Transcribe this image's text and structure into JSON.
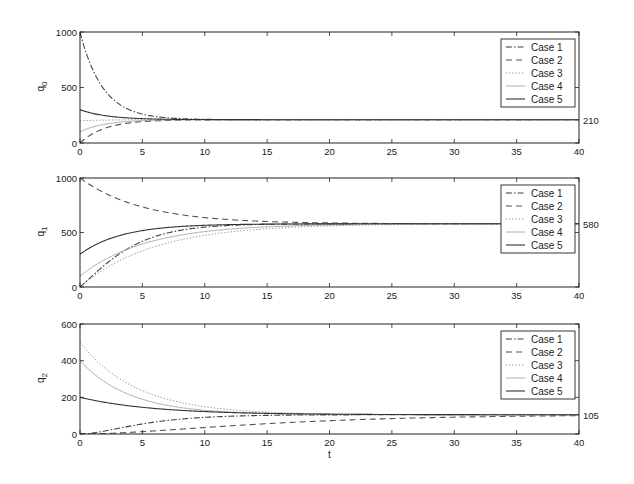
{
  "chart_data": [
    {
      "type": "line",
      "panel": "top",
      "ylabel": "q",
      "ylabel_sub": "0",
      "xlabel": "",
      "xlim": [
        0,
        40
      ],
      "ylim": [
        0,
        1000
      ],
      "xticks": [
        0,
        5,
        10,
        15,
        20,
        25,
        30,
        35,
        40
      ],
      "yticks": [
        0,
        500,
        1000
      ],
      "steady_state_label": "210",
      "steady_state": 210,
      "legend": [
        "Case 1",
        "Case 2",
        "Case 3",
        "Case 4",
        "Case 5"
      ],
      "legend_position": "upper right",
      "grid": false,
      "series": [
        {
          "name": "Case 1",
          "style": "dashdot",
          "initial": 1000,
          "rate": 0.55
        },
        {
          "name": "Case 2",
          "style": "dashed",
          "initial": 0,
          "rate": 0.5
        },
        {
          "name": "Case 3",
          "style": "dotted",
          "initial": 200,
          "rate": 0.5
        },
        {
          "name": "Case 4",
          "style": "thin",
          "initial": 100,
          "rate": 0.5
        },
        {
          "name": "Case 5",
          "style": "solid",
          "initial": 300,
          "rate": 0.45
        }
      ]
    },
    {
      "type": "line",
      "panel": "middle",
      "ylabel": "q",
      "ylabel_sub": "1",
      "xlabel": "",
      "xlim": [
        0,
        40
      ],
      "ylim": [
        0,
        1000
      ],
      "xticks": [
        0,
        5,
        10,
        15,
        20,
        25,
        30,
        35,
        40
      ],
      "yticks": [
        0,
        500,
        1000
      ],
      "steady_state_label": "580",
      "steady_state": 580,
      "legend": [
        "Case 1",
        "Case 2",
        "Case 3",
        "Case 4",
        "Case 5"
      ],
      "legend_position": "upper right",
      "grid": false,
      "series": [
        {
          "name": "Case 1",
          "style": "dashdot",
          "initial": 0,
          "rate": 0.42,
          "peak_shape": "sigmoid"
        },
        {
          "name": "Case 2",
          "style": "dashed",
          "initial": 1000,
          "rate": 0.2
        },
        {
          "name": "Case 3",
          "style": "dotted",
          "initial": 0,
          "rate": 0.17
        },
        {
          "name": "Case 4",
          "style": "thin",
          "initial": 100,
          "rate": 0.19
        },
        {
          "name": "Case 5",
          "style": "solid",
          "initial": 300,
          "rate": 0.3
        }
      ]
    },
    {
      "type": "line",
      "panel": "bottom",
      "ylabel": "q",
      "ylabel_sub": "2",
      "xlabel": "t",
      "xlim": [
        0,
        40
      ],
      "ylim": [
        0,
        600
      ],
      "xticks": [
        0,
        5,
        10,
        15,
        20,
        25,
        30,
        35,
        40
      ],
      "yticks": [
        0,
        200,
        400,
        600
      ],
      "steady_state_label": "105",
      "steady_state": 105,
      "legend": [
        "Case 1",
        "Case 2",
        "Case 3",
        "Case 4",
        "Case 5"
      ],
      "legend_position": "upper right",
      "grid": false,
      "series": [
        {
          "name": "Case 1",
          "style": "dashdot",
          "initial": 0,
          "rate": 0.35,
          "peak_shape": "rise"
        },
        {
          "name": "Case 2",
          "style": "dashed",
          "initial": 0,
          "rate": 0.12,
          "peak_shape": "rise"
        },
        {
          "name": "Case 3",
          "style": "dotted",
          "initial": 500,
          "rate": 0.22
        },
        {
          "name": "Case 4",
          "style": "thin",
          "initial": 400,
          "rate": 0.25
        },
        {
          "name": "Case 5",
          "style": "solid",
          "initial": 200,
          "rate": 0.17
        }
      ]
    }
  ],
  "layout": {
    "panels": [
      {
        "x0": 80,
        "x1": 579,
        "y0": 32,
        "y1": 143
      },
      {
        "x0": 80,
        "x1": 579,
        "y0": 178,
        "y1": 287
      },
      {
        "x0": 80,
        "x1": 579,
        "y0": 324,
        "y1": 434
      }
    ]
  },
  "colors": {
    "axes": "#222222",
    "case1": "#444444",
    "case2": "#555555",
    "case3": "#888888",
    "case4": "#999999",
    "case5": "#333333"
  }
}
